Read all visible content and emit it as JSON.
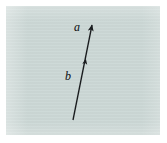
{
  "figure": {
    "kind": "vector-diagram",
    "plate_color": "#ccd8d6",
    "page_color": "#ffffff",
    "ink_color": "#1a1d1f",
    "labels": {
      "head_label": "a",
      "tail_label": "b"
    },
    "arrow": {
      "tail": {
        "x": 73,
        "y": 120
      },
      "head": {
        "x": 92,
        "y": 25
      },
      "mid_marker": {
        "x": 86,
        "y": 58
      },
      "head_arrowhead": true,
      "mid_arrowhead": true
    },
    "plate": {
      "x": 6,
      "y": 6,
      "width": 154,
      "height": 129
    }
  }
}
